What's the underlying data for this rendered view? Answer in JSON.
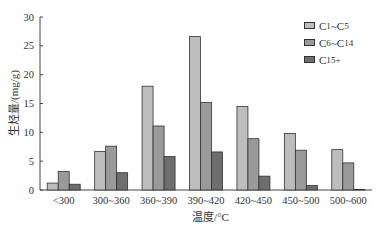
{
  "chart_data": {
    "type": "bar",
    "title": "",
    "xlabel": "温度/°C",
    "ylabel": "生烃量/(mg/g)",
    "ylim": [
      0,
      30
    ],
    "yticks": [
      0,
      5,
      10,
      15,
      20,
      25,
      30
    ],
    "grid": false,
    "legend_position": "upper right",
    "categories": [
      "<300",
      "300~360",
      "360~390",
      "390~420",
      "420~450",
      "450~500",
      "500~600"
    ],
    "series": [
      {
        "name": "C1~C5",
        "color": "#bdbdbd",
        "values": [
          1.2,
          6.7,
          18.0,
          26.6,
          14.5,
          9.8,
          7.0
        ]
      },
      {
        "name": "C6~C14",
        "color": "#9a9a9a",
        "values": [
          3.2,
          7.6,
          11.1,
          15.2,
          8.9,
          6.9,
          4.7
        ]
      },
      {
        "name": "C15+",
        "color": "#6e6e6e",
        "values": [
          1.0,
          3.0,
          5.8,
          6.6,
          2.4,
          0.8,
          0.1
        ]
      }
    ]
  },
  "legend": {
    "items": [
      {
        "base": "C",
        "sub1": "1",
        "mid": "~C",
        "sub2": "5"
      },
      {
        "base": "C",
        "sub1": "6",
        "mid": "~C",
        "sub2": "14"
      },
      {
        "base": "C",
        "sub1": "15+",
        "mid": "",
        "sub2": ""
      }
    ]
  }
}
